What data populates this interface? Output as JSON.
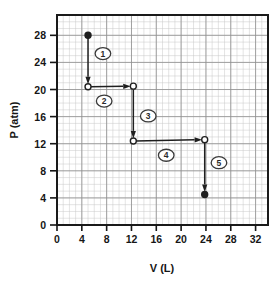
{
  "figure": {
    "background_color": "#ffffff",
    "frame_color": "#1a1a1a",
    "grid_minor_color": "#c9c9c9",
    "grid_major_color": "#8f8f8f",
    "ink_color": "#1f1f1f"
  },
  "chart_data": {
    "type": "line",
    "title": "",
    "xlabel": "V (L)",
    "ylabel": "P (atm)",
    "xlim": [
      0,
      34
    ],
    "ylim": [
      0,
      31
    ],
    "xticks": [
      0,
      4,
      8,
      12,
      16,
      20,
      24,
      28,
      32
    ],
    "xtick_labels": [
      "0",
      "4",
      "8",
      "12",
      "16",
      "20",
      "24",
      "28",
      "32"
    ],
    "yticks": [
      0,
      4,
      8,
      12,
      16,
      20,
      24,
      28
    ],
    "ytick_labels": [
      "0",
      "4",
      "8",
      "12",
      "16",
      "20",
      "24",
      "28"
    ],
    "grid": true,
    "grid_minor_step": 1,
    "grid_major_step": 4,
    "legend": "none",
    "markers": [
      {
        "id": "start",
        "x": 5.0,
        "y": 28.0,
        "style": "filled",
        "label": "initial state"
      },
      {
        "id": "a",
        "x": 5.0,
        "y": 20.4,
        "style": "open",
        "label": ""
      },
      {
        "id": "b",
        "x": 12.3,
        "y": 20.5,
        "style": "open",
        "label": ""
      },
      {
        "id": "c",
        "x": 12.3,
        "y": 12.4,
        "style": "open",
        "label": ""
      },
      {
        "id": "d",
        "x": 23.8,
        "y": 12.6,
        "style": "open",
        "label": ""
      },
      {
        "id": "end",
        "x": 23.8,
        "y": 4.5,
        "style": "filled",
        "label": "final state"
      }
    ],
    "steps": [
      {
        "number": "1",
        "from": [
          5.0,
          28.0
        ],
        "to": [
          5.0,
          20.4
        ],
        "direction": "down",
        "label_x": 7.4,
        "label_y": 25.3
      },
      {
        "number": "2",
        "from": [
          5.0,
          20.4
        ],
        "to": [
          12.3,
          20.5
        ],
        "direction": "right",
        "label_x": 7.6,
        "label_y": 18.3
      },
      {
        "number": "3",
        "from": [
          12.3,
          20.5
        ],
        "to": [
          12.3,
          12.4
        ],
        "direction": "down",
        "label_x": 14.7,
        "label_y": 16.1
      },
      {
        "number": "4",
        "from": [
          12.3,
          12.4
        ],
        "to": [
          23.8,
          12.6
        ],
        "direction": "right",
        "label_x": 17.6,
        "label_y": 10.3
      },
      {
        "number": "5",
        "from": [
          23.8,
          12.6
        ],
        "to": [
          23.8,
          4.5
        ],
        "direction": "down",
        "label_x": 26.1,
        "label_y": 9.2
      }
    ]
  }
}
